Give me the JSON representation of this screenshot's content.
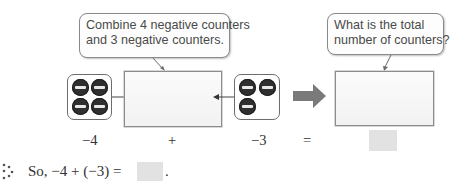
{
  "callouts": {
    "combine": {
      "line1": "Combine 4 negative counters",
      "line2": "and 3 negative counters."
    },
    "total": {
      "line1": "What is the total",
      "line2": "number of counters?"
    }
  },
  "model": {
    "left_group": {
      "count": 4,
      "sign": "negative",
      "label": "−4"
    },
    "plus_label": "+",
    "right_group": {
      "count": 3,
      "sign": "negative",
      "label": "−3"
    },
    "equals_label": "=",
    "counter_color": "#2f2f2f",
    "arrow_color": "#7a7a7a"
  },
  "conclusion": {
    "prefix": "So, −4 + (−3) =",
    "suffix": ".",
    "icon": "therefore-dots-icon"
  }
}
